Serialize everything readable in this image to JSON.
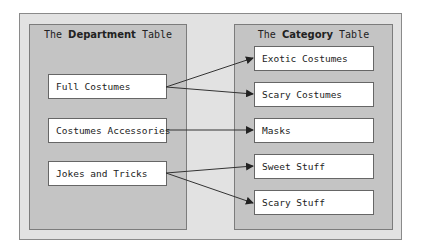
{
  "department_panel": {
    "title_prefix": "The ",
    "title_bold": "Department",
    "title_suffix": " Table",
    "items": [
      {
        "label": "Full Costumes"
      },
      {
        "label": "Costumes Accessories"
      },
      {
        "label": "Jokes and Tricks"
      }
    ]
  },
  "category_panel": {
    "title_prefix": "The ",
    "title_bold": "Category",
    "title_suffix": " Table",
    "items": [
      {
        "label": "Exotic Costumes"
      },
      {
        "label": "Scary Costumes"
      },
      {
        "label": "Masks"
      },
      {
        "label": "Sweet Stuff"
      },
      {
        "label": "Scary Stuff"
      }
    ]
  },
  "relationships": [
    {
      "from": "Full Costumes",
      "to": "Exotic Costumes"
    },
    {
      "from": "Full Costumes",
      "to": "Scary Costumes"
    },
    {
      "from": "Costumes Accessories",
      "to": "Masks"
    },
    {
      "from": "Jokes and Tricks",
      "to": "Sweet Stuff"
    },
    {
      "from": "Jokes and Tricks",
      "to": "Scary Stuff"
    }
  ]
}
